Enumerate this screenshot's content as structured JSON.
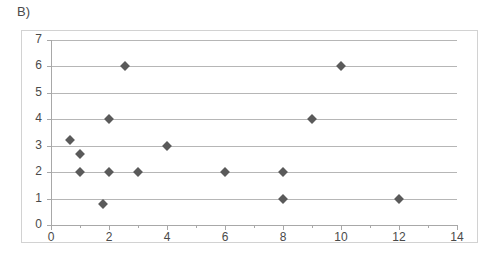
{
  "panel": {
    "label": "B)"
  },
  "chart_data": {
    "type": "scatter",
    "title": "",
    "subtitle": "",
    "xlabel": "",
    "ylabel": "",
    "xlim": [
      0,
      14
    ],
    "ylim": [
      0,
      7
    ],
    "grid": true,
    "legend": false,
    "legend_position": "none",
    "marker": {
      "shape": "diamond",
      "color": "#5a5a5a",
      "size": 7
    },
    "xticks": [
      0,
      2,
      4,
      6,
      8,
      10,
      12,
      14
    ],
    "xtick_labels": [
      "0",
      "2",
      "4",
      "6",
      "8",
      "10",
      "12",
      "14"
    ],
    "xminor_ticks": [
      1,
      3,
      5,
      7,
      9,
      11,
      13
    ],
    "yticks": [
      0,
      1,
      2,
      3,
      4,
      5,
      6,
      7
    ],
    "ytick_labels": [
      "0",
      "1",
      "2",
      "3",
      "4",
      "5",
      "6",
      "7"
    ],
    "series": [
      {
        "name": "series-1",
        "color": "#5a5a5a",
        "points": [
          {
            "x": 0.65,
            "y": 3.2
          },
          {
            "x": 1.0,
            "y": 2.7
          },
          {
            "x": 1.0,
            "y": 2.0
          },
          {
            "x": 1.8,
            "y": 0.8
          },
          {
            "x": 2.0,
            "y": 4.0
          },
          {
            "x": 2.0,
            "y": 2.0
          },
          {
            "x": 2.55,
            "y": 6.0
          },
          {
            "x": 3.0,
            "y": 2.0
          },
          {
            "x": 4.0,
            "y": 3.0
          },
          {
            "x": 6.0,
            "y": 2.0
          },
          {
            "x": 8.0,
            "y": 2.0
          },
          {
            "x": 8.0,
            "y": 1.0
          },
          {
            "x": 9.0,
            "y": 4.0
          },
          {
            "x": 10.0,
            "y": 6.0
          },
          {
            "x": 12.0,
            "y": 1.0
          }
        ]
      }
    ],
    "colors": {
      "marker": "#5a5a5a",
      "gridline": "#b6b6b6",
      "axis": "#a8a8a8",
      "frame": "#d2d2d2",
      "text": "#4a4a4a",
      "background": "#ffffff"
    }
  }
}
